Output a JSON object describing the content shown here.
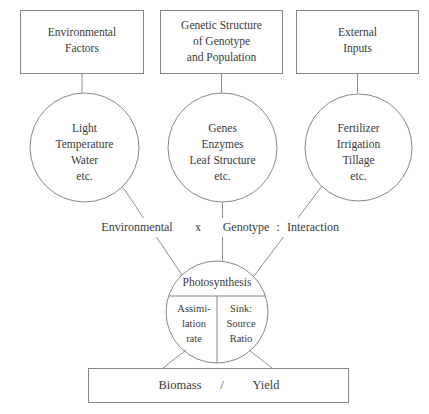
{
  "diagram": {
    "colors": {
      "stroke": "#878787",
      "connector": "#8d8d8d",
      "text": "#3a3a3a",
      "background": "#ffffff"
    },
    "top_boxes": [
      {
        "id": "environmental-factors",
        "lines": [
          "Environmental",
          "Factors"
        ]
      },
      {
        "id": "genetic-structure",
        "lines": [
          "Genetic Structure",
          "of Genotype",
          "and Population"
        ]
      },
      {
        "id": "external-inputs",
        "lines": [
          "External",
          "Inputs"
        ]
      }
    ],
    "circles": [
      {
        "id": "environment-circle",
        "lines": [
          "Light",
          "Temperature",
          "Water",
          "etc."
        ]
      },
      {
        "id": "genotype-circle",
        "lines": [
          "Genes",
          "Enzymes",
          "Leaf Structure",
          "etc."
        ]
      },
      {
        "id": "inputs-circle",
        "lines": [
          "Fertilizer",
          "Irrigation",
          "Tillage",
          "etc."
        ]
      }
    ],
    "equation": {
      "term1": "Environmental",
      "operator": "x",
      "term2": "Genotype",
      "colon": ":",
      "term3": "Interaction"
    },
    "photosynthesis": {
      "title": "Photosynthesis",
      "left_lines": [
        "Assimi-",
        "lation",
        "rate"
      ],
      "right_lines": [
        "Sink:",
        "Source",
        "Ratio"
      ]
    },
    "output_box": {
      "left": "Biomass",
      "separator": "/",
      "right": "Yield"
    }
  }
}
